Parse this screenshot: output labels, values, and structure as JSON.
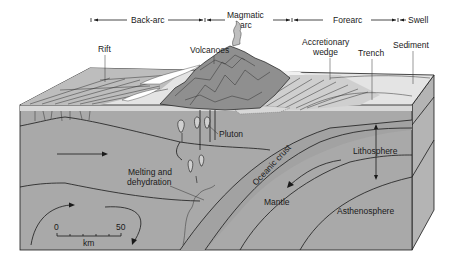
{
  "header": {
    "zones": [
      {
        "label": "Back-arc"
      },
      {
        "label": "Magmatic"
      },
      {
        "label": "arc"
      },
      {
        "label": "Forearc"
      },
      {
        "label": "Swell"
      }
    ]
  },
  "labels": {
    "rift": "Rift",
    "volcanoes": "Volcanoes",
    "accretionary_1": "Accretionary",
    "accretionary_2": "wedge",
    "trench": "Trench",
    "sediment": "Sediment",
    "pluton": "Pluton",
    "lithosphere": "Lithosphere",
    "oceanic_crust": "Oceanic crust",
    "melting_1": "Melting and",
    "melting_2": "dehydration",
    "mantle": "Mantle",
    "asthenosphere": "Asthenosphere"
  },
  "scale_bar": {
    "min": "0",
    "max": "50",
    "unit": "km"
  },
  "colors": {
    "block_front": "#a9a9a9",
    "block_side": "#b4b4b4",
    "surface_light": "#e4e4e4",
    "surface_mid": "#c6c6c6",
    "mountains": "#8f8f8f",
    "water_top": "#ededed",
    "line": "#1a1a1a"
  }
}
